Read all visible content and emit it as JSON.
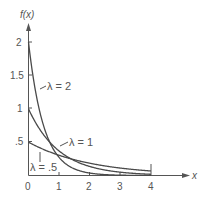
{
  "chart_data": {
    "type": "line",
    "title": "",
    "xlabel": "x",
    "ylabel": "f(x)",
    "xlim": [
      0,
      4
    ],
    "ylim": [
      0,
      2
    ],
    "grid": false,
    "x_ticks": [
      "0",
      "1",
      "2",
      "3",
      "4"
    ],
    "y_ticks": [
      ".5",
      "1",
      "1.5",
      "2"
    ],
    "function": "f(x) = λ e^(-λx)",
    "series": [
      {
        "name": "λ = 2",
        "lambda": 2,
        "x": [
          0,
          0.25,
          0.5,
          1,
          1.5,
          2,
          3,
          4
        ],
        "values": [
          2,
          1.213,
          0.736,
          0.271,
          0.1,
          0.037,
          0.005,
          0.001
        ]
      },
      {
        "name": "λ = 1",
        "lambda": 1,
        "x": [
          0,
          0.25,
          0.5,
          1,
          1.5,
          2,
          3,
          4
        ],
        "values": [
          1,
          0.779,
          0.607,
          0.368,
          0.223,
          0.135,
          0.05,
          0.018
        ]
      },
      {
        "name": "λ = .5",
        "lambda": 0.5,
        "x": [
          0,
          0.25,
          0.5,
          1,
          1.5,
          2,
          3,
          4
        ],
        "values": [
          0.5,
          0.441,
          0.389,
          0.303,
          0.236,
          0.184,
          0.112,
          0.068
        ]
      }
    ],
    "annotations": [
      {
        "text": "λ = 2",
        "points_to": "λ=2 curve near x≈0.3"
      },
      {
        "text": "λ = 1",
        "points_to": "λ=1 curve near x≈0.9"
      },
      {
        "text": "λ = .5",
        "points_to": "λ=.5 curve near x≈0.3"
      }
    ]
  },
  "labels": {
    "y_axis": "f(x)",
    "x_axis": "x",
    "lambda2": "λ = 2",
    "lambda1": "λ = 1",
    "lambda05": "λ = .5",
    "tick_x0": "0",
    "tick_x1": "1",
    "tick_x2": "2",
    "tick_x3": "3",
    "tick_x4": "4",
    "tick_y05": ".5",
    "tick_y1": "1",
    "tick_y15": "1.5",
    "tick_y2": "2"
  }
}
